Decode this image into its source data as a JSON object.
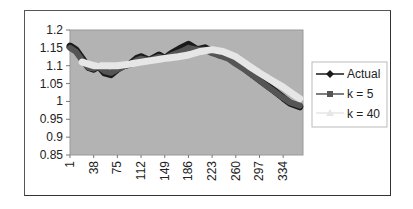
{
  "chart_data": {
    "type": "line",
    "title": "",
    "xlabel": "",
    "ylabel": "",
    "ylim": [
      0.85,
      1.2
    ],
    "y_ticks": [
      "1.2",
      "1.15",
      "1.1",
      "1.05",
      "1",
      "0.95",
      "0.9",
      "0.85"
    ],
    "x_ticks": [
      "1",
      "38",
      "75",
      "112",
      "149",
      "186",
      "223",
      "260",
      "297",
      "334"
    ],
    "grid": false,
    "legend_position": "right",
    "plot_background": "#b3b3b3",
    "series": [
      {
        "name": "Actual",
        "color": "#1a1a1a",
        "marker": "diamond",
        "x": [
          1,
          10,
          20,
          30,
          38,
          45,
          55,
          65,
          75,
          85,
          95,
          105,
          112,
          125,
          140,
          149,
          160,
          175,
          186,
          200,
          212,
          223,
          235,
          248,
          260,
          275,
          290,
          305,
          320,
          334,
          345,
          360
        ],
        "values": [
          1.155,
          1.145,
          1.12,
          1.095,
          1.09,
          1.1,
          1.08,
          1.075,
          1.09,
          1.1,
          1.105,
          1.12,
          1.125,
          1.115,
          1.13,
          1.12,
          1.135,
          1.15,
          1.16,
          1.145,
          1.15,
          1.14,
          1.13,
          1.125,
          1.11,
          1.09,
          1.07,
          1.05,
          1.03,
          1.01,
          0.995,
          0.985
        ]
      },
      {
        "name": "k = 5",
        "color": "#555555",
        "marker": "square",
        "x": [
          1,
          10,
          20,
          30,
          38,
          45,
          55,
          65,
          75,
          85,
          95,
          105,
          112,
          125,
          140,
          149,
          160,
          175,
          186,
          200,
          212,
          223,
          235,
          248,
          260,
          275,
          290,
          305,
          320,
          334,
          345,
          360
        ],
        "values": [
          1.15,
          1.14,
          1.115,
          1.095,
          1.092,
          1.098,
          1.085,
          1.08,
          1.09,
          1.098,
          1.103,
          1.115,
          1.12,
          1.115,
          1.125,
          1.12,
          1.13,
          1.14,
          1.15,
          1.145,
          1.145,
          1.135,
          1.128,
          1.12,
          1.105,
          1.088,
          1.068,
          1.048,
          1.028,
          1.01,
          0.997,
          0.988
        ]
      },
      {
        "name": "k = 40",
        "color": "#e6e6e6",
        "marker": "triangle",
        "x": [
          20,
          38,
          55,
          75,
          95,
          112,
          130,
          149,
          170,
          186,
          205,
          223,
          240,
          260,
          280,
          297,
          315,
          334,
          350,
          360
        ],
        "values": [
          1.11,
          1.1,
          1.1,
          1.1,
          1.105,
          1.11,
          1.115,
          1.12,
          1.125,
          1.13,
          1.14,
          1.145,
          1.14,
          1.125,
          1.1,
          1.08,
          1.06,
          1.04,
          1.02,
          1.008
        ]
      }
    ]
  },
  "legend": {
    "items": [
      {
        "label": "Actual"
      },
      {
        "label": "k = 5"
      },
      {
        "label": "k = 40"
      }
    ]
  }
}
